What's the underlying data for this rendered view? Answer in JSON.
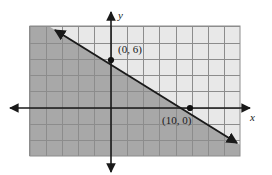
{
  "figure": {
    "type": "coordinate-plane-graph",
    "width": 272,
    "height": 175,
    "background_color": "#ffffff"
  },
  "axes": {
    "x_label": "x",
    "y_label": "y",
    "x_axis_color": "#1a1a1a",
    "y_axis_color": "#1a1a1a",
    "origin_px": {
      "x": 111,
      "y": 108
    },
    "unit_px": 8,
    "x_arrow_left_px": 10,
    "x_arrow_right_px": 250,
    "y_arrow_top_px": 12,
    "y_arrow_bottom_px": 172
  },
  "grid": {
    "left_px": 30,
    "top_px": 26,
    "right_px": 240,
    "bottom_px": 156,
    "cell_px": 16.25,
    "cell_units": 2,
    "fill_color": "#e8e8e8",
    "line_color": "#8c8c8c",
    "visible": true
  },
  "shading": {
    "region": "below-left-of-line",
    "fill_color": "#a8a8a8",
    "opacity": 1
  },
  "line": {
    "style": "solid",
    "color": "#1a1a1a",
    "arrows": "both",
    "start_px": {
      "x": 55,
      "y": 30
    },
    "end_px": {
      "x": 237,
      "y": 143
    },
    "slope": -0.6,
    "y_intercept": 6,
    "x_intercept": 10
  },
  "points": [
    {
      "name": "y-intercept",
      "label": "(0, 6)",
      "coords": {
        "x": 0,
        "y": 6
      },
      "px": {
        "x": 111,
        "y": 60
      },
      "label_px": {
        "x": 118,
        "y": 53
      }
    },
    {
      "name": "x-intercept",
      "label": "(10, 0)",
      "coords": {
        "x": 10,
        "y": 0
      },
      "px": {
        "x": 190,
        "y": 108
      },
      "label_px": {
        "x": 162,
        "y": 124
      }
    }
  ],
  "chart_data": {
    "type": "line",
    "title": "",
    "xlabel": "x",
    "ylabel": "y",
    "series": [
      {
        "name": "boundary-line",
        "points": [
          [
            0,
            6
          ],
          [
            10,
            0
          ]
        ],
        "slope": -0.6,
        "intercept": 6
      }
    ],
    "annotations": [
      "(0, 6)",
      "(10, 0)"
    ],
    "shaded_region": "below-left-of-line",
    "grid": true,
    "legend": "none"
  }
}
